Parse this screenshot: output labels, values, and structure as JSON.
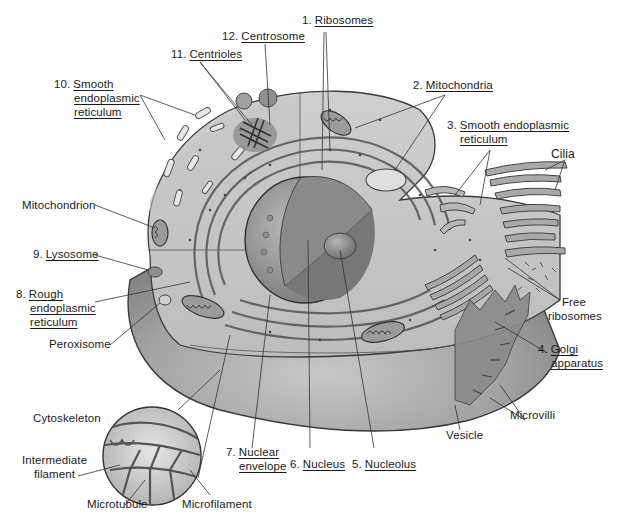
{
  "diagram": {
    "colors": {
      "background": "#ffffff",
      "cytoplasm_light": "#d9d9d9",
      "cytoplasm_mid": "#b9b9b9",
      "cell_body_dark": "#8f8f8f",
      "organelle": "#9a9a9a",
      "organelle_dark": "#6e6e6e",
      "leader_line": "#333333",
      "text": "#1a1a1a"
    },
    "labels": [
      {
        "id": "ribosomes",
        "number": "1.",
        "lines": [
          "Ribosomes"
        ],
        "underlined": true
      },
      {
        "id": "mitochondria",
        "number": "2.",
        "lines": [
          "Mitochondria"
        ],
        "underlined": true
      },
      {
        "id": "smooth-er-right",
        "number": "3.",
        "lines": [
          "Smooth endoplasmic",
          "reticulum"
        ],
        "underlined": true
      },
      {
        "id": "golgi",
        "number": "4.",
        "lines": [
          "Golgi",
          "apparatus"
        ],
        "underlined": true
      },
      {
        "id": "nucleolus",
        "number": "5.",
        "lines": [
          "Nucleolus"
        ],
        "underlined": true
      },
      {
        "id": "nucleus",
        "number": "6.",
        "lines": [
          "Nucleus"
        ],
        "underlined": true
      },
      {
        "id": "nuclear-envelope",
        "number": "7.",
        "lines": [
          "Nuclear",
          "envelope"
        ],
        "underlined": true
      },
      {
        "id": "rough-er",
        "number": "8.",
        "lines": [
          "Rough",
          "endoplasmic",
          "reticulum"
        ],
        "underlined": true
      },
      {
        "id": "lysosome",
        "number": "9.",
        "lines": [
          "Lysosome"
        ],
        "underlined": true
      },
      {
        "id": "smooth-er-left",
        "number": "10.",
        "lines": [
          "Smooth",
          "endoplasmic",
          "reticulum"
        ],
        "underlined": true
      },
      {
        "id": "centrioles",
        "number": "11.",
        "lines": [
          "Centrioles"
        ],
        "underlined": true
      },
      {
        "id": "centrosome",
        "number": "12.",
        "lines": [
          "Centrosome"
        ],
        "underlined": true
      },
      {
        "id": "mitochondrion",
        "number": "",
        "lines": [
          "Mitochondrion"
        ],
        "underlined": false
      },
      {
        "id": "peroxisome",
        "number": "",
        "lines": [
          "Peroxisome"
        ],
        "underlined": false
      },
      {
        "id": "cilia",
        "number": "",
        "lines": [
          "Cilia"
        ],
        "underlined": false
      },
      {
        "id": "free-ribosomes",
        "number": "",
        "lines": [
          "Free",
          "ribosomes"
        ],
        "underlined": false
      },
      {
        "id": "microvilli",
        "number": "",
        "lines": [
          "Microvilli"
        ],
        "underlined": false
      },
      {
        "id": "vesicle",
        "number": "",
        "lines": [
          "Vesicle"
        ],
        "underlined": false
      },
      {
        "id": "cytoskeleton",
        "number": "",
        "lines": [
          "Cytoskeleton"
        ],
        "underlined": false
      },
      {
        "id": "intermediate-filament",
        "number": "",
        "lines": [
          "Intermediate",
          "filament"
        ],
        "underlined": false
      },
      {
        "id": "microtubule",
        "number": "",
        "lines": [
          "Microtubule"
        ],
        "underlined": false
      },
      {
        "id": "microfilament",
        "number": "",
        "lines": [
          "Microfilament"
        ],
        "underlined": false
      }
    ]
  }
}
